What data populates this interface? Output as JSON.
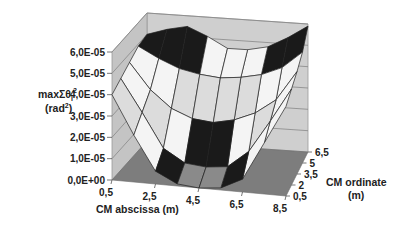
{
  "chart_data": {
    "type": "surface",
    "title": "",
    "zlabel_line1": "maxΣθ",
    "zlabel_sub": "i",
    "zlabel_sup": "2",
    "zlabel_line2": "(rad",
    "zlabel_line2_sup": "2",
    "zlabel_line2_end": ")",
    "xlabel": "CM abscissa (m)",
    "ylabel_line1": "CM ordinate",
    "ylabel_line2": "(m)",
    "z_ticks": [
      "0,0E+00",
      "1,0E-05",
      "2,0E-05",
      "3,0E-05",
      "4,0E-05",
      "5,0E-05",
      "6,0E-05"
    ],
    "z_range": [
      0,
      6e-05
    ],
    "x_ticks": [
      "0,5",
      "2,5",
      "4,5",
      "6,5",
      "8,5"
    ],
    "x_values": [
      0.5,
      1.5,
      2.5,
      3.5,
      4.5,
      5.5,
      6.5,
      7.5,
      8.5
    ],
    "y_ticks": [
      "0,5",
      "2",
      "3,5",
      "5",
      "6,5"
    ],
    "y_values": [
      0.5,
      2,
      3.5,
      5,
      6.5
    ],
    "band_colors": [
      "#8a8a8a",
      "#1a1a1a",
      "#f4f4f4",
      "#dcdcdc",
      "#f4f4f4",
      "#1a1a1a",
      "#8a8a8a"
    ],
    "z_values": [
      [
        4e-05,
        2.2e-05,
        6e-06,
        1e-06,
        0.0,
        1e-06,
        6e-06,
        2.4e-05,
        4.2e-05
      ],
      [
        4.3e-05,
        2.8e-05,
        1.2e-05,
        6e-06,
        5e-06,
        6e-06,
        1.4e-05,
        2.9e-05,
        4.5e-05
      ],
      [
        4.6e-05,
        3.4e-05,
        2.6e-05,
        2.2e-05,
        2.1e-05,
        2.3e-05,
        2.7e-05,
        3.4e-05,
        4.8e-05
      ],
      [
        4.9e-05,
        4.4e-05,
        4e-05,
        3.8e-05,
        3.7e-05,
        3.8e-05,
        4e-05,
        4.4e-05,
        5.2e-05
      ],
      [
        5e-05,
        5.3e-05,
        5.5e-05,
        5.1e-05,
        4.6e-05,
        4.6e-05,
        4.8e-05,
        5.3e-05,
        5.9e-05
      ]
    ]
  }
}
